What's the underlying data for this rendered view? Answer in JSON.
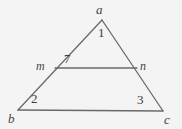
{
  "diagram": {
    "type": "euclidean-triangle-with-transversal",
    "canvas": {
      "width": 182,
      "height": 129,
      "background": "#f4f4f4"
    },
    "stroke": {
      "color": "#6a6a6a",
      "width": 1.3
    },
    "vertices": {
      "a": {
        "label": "a",
        "x": 102,
        "y": 20
      },
      "b": {
        "label": "b",
        "x": 18,
        "y": 110
      },
      "c": {
        "label": "c",
        "x": 163,
        "y": 111
      }
    },
    "transversal_points": {
      "m": {
        "label": "m",
        "x": 55,
        "y": 68
      },
      "n": {
        "label": "n",
        "x": 137,
        "y": 68
      }
    },
    "segments": [
      {
        "name": "side-ab",
        "from": "a",
        "to": "b"
      },
      {
        "name": "side-ac",
        "from": "a",
        "to": "c"
      },
      {
        "name": "side-bc",
        "from": "b",
        "to": "c"
      },
      {
        "name": "transversal-mn",
        "from": "m",
        "to": "n"
      }
    ],
    "angle_labels": [
      {
        "name": "angle-1",
        "text": "1",
        "at_vertex": "a",
        "x": 102,
        "y": 32
      },
      {
        "name": "angle-7",
        "text": "7",
        "at_vertex": "m",
        "x": 68,
        "y": 58
      },
      {
        "name": "angle-2",
        "text": "2",
        "at_vertex": "b",
        "x": 35,
        "y": 98
      },
      {
        "name": "angle-3",
        "text": "3",
        "at_vertex": "c",
        "x": 141,
        "y": 99
      }
    ]
  }
}
